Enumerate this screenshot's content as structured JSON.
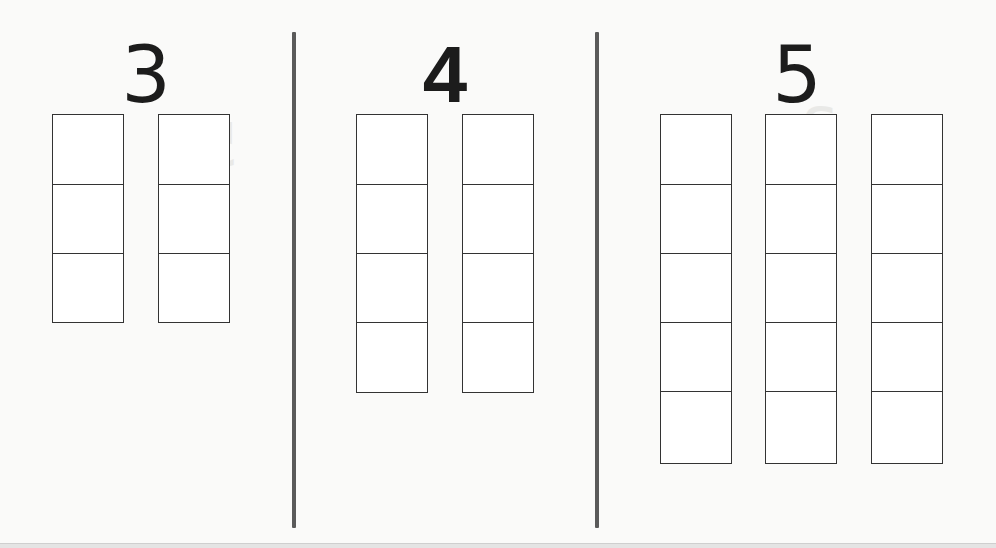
{
  "worksheet": {
    "sections": [
      {
        "numeral": "3",
        "columns": 2,
        "cells_per_column": 3,
        "column_x": [
          52,
          158
        ]
      },
      {
        "numeral": "4",
        "columns": 2,
        "cells_per_column": 4,
        "column_x": [
          356,
          462
        ]
      },
      {
        "numeral": "5",
        "columns": 3,
        "cells_per_column": 5,
        "column_x": [
          660,
          765,
          871
        ]
      }
    ],
    "divider_x": [
      293,
      596
    ],
    "colors": {
      "background": "#fafaf9",
      "line": "#333333",
      "divider": "#5a5a5a",
      "numeral": "#1c1c1c"
    }
  }
}
